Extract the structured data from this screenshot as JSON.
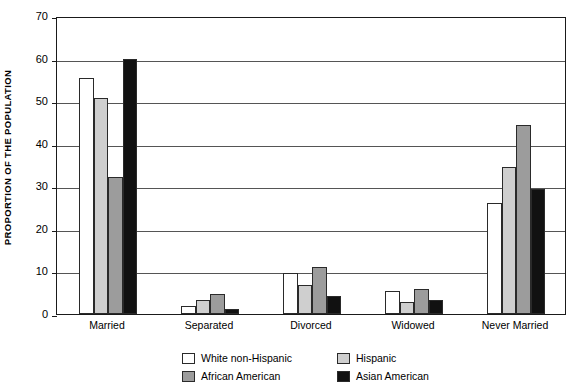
{
  "chart_data": {
    "type": "bar",
    "title": "",
    "xlabel": "",
    "ylabel": "PROPORTION OF THE POPULATION",
    "ylim": [
      0,
      70
    ],
    "ytick_step": 10,
    "yticks": [
      "0",
      "10",
      "20",
      "30",
      "40",
      "50",
      "60",
      "70"
    ],
    "grid": true,
    "legend_position": "bottom",
    "categories": [
      "Married",
      "Separated",
      "Divorced",
      "Widowed",
      "Never Married"
    ],
    "series": [
      {
        "name": "White non-Hispanic",
        "color": "#ffffff",
        "values": [
          55.5,
          1.8,
          9.6,
          5.4,
          26.0
        ]
      },
      {
        "name": "Hispanic",
        "color": "#cfcfcf",
        "values": [
          50.7,
          3.4,
          6.9,
          2.8,
          34.5
        ]
      },
      {
        "name": "African American",
        "color": "#9c9c9c",
        "values": [
          32.3,
          4.8,
          11.0,
          5.9,
          44.4
        ]
      },
      {
        "name": "Asian American",
        "color": "#111111",
        "values": [
          60.0,
          1.2,
          4.3,
          3.3,
          29.4
        ]
      }
    ]
  },
  "axis": {
    "frame_color": "#1a1a1a",
    "gridline_color": "#555555"
  },
  "legend": {
    "entries": [
      {
        "label": "White non-Hispanic",
        "color": "#ffffff"
      },
      {
        "label": "Hispanic",
        "color": "#cfcfcf"
      },
      {
        "label": "African American",
        "color": "#9c9c9c"
      },
      {
        "label": "Asian American",
        "color": "#111111"
      }
    ]
  }
}
